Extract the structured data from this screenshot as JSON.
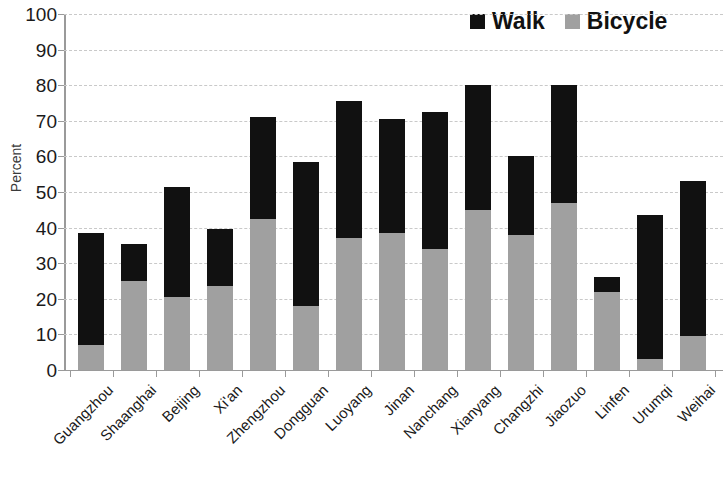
{
  "chart_data": {
    "type": "bar",
    "subtype": "stacked-vertical",
    "title": "",
    "xlabel": "",
    "ylabel": "Percent",
    "ylim": [
      0,
      100
    ],
    "yticks": [
      0,
      10,
      20,
      30,
      40,
      50,
      60,
      70,
      80,
      90,
      100
    ],
    "ytick_labels": [
      "0",
      "10",
      "20",
      "30",
      "40",
      "50",
      "60",
      "70",
      "80",
      "90",
      "100"
    ],
    "grid": true,
    "legend_position": "top-right",
    "categories": [
      "Guangzhou",
      "Shaanghai",
      "Beijing",
      "Xi'an",
      "Zhengzhou",
      "Dongguan",
      "Luoyang",
      "Jinan",
      "Nanchang",
      "Xianyang",
      "Changzhi",
      "Jiaozuo",
      "Linfen",
      "Urumqi",
      "Weihai"
    ],
    "series": [
      {
        "name": "Bicycle",
        "color": "#a0a0a0",
        "values": [
          7,
          25,
          20.5,
          23.5,
          42.5,
          18,
          37,
          38.5,
          34,
          45,
          38,
          47,
          22,
          3,
          9.5
        ]
      },
      {
        "name": "Walk",
        "color": "#111111",
        "values": [
          31.5,
          10.5,
          31,
          16,
          28.5,
          40.5,
          38.5,
          32,
          38.5,
          35,
          22,
          33,
          4,
          40.5,
          43.5
        ]
      }
    ],
    "totals": [
      38.5,
      35.5,
      51.5,
      39.5,
      71,
      58.5,
      75.5,
      70.5,
      72.5,
      80,
      60,
      80,
      26,
      43.5,
      53
    ]
  },
  "legend": {
    "entries": [
      {
        "label": "Walk",
        "color": "#111111"
      },
      {
        "label": "Bicycle",
        "color": "#a0a0a0"
      }
    ]
  },
  "axis": {
    "y_title": "Percent"
  }
}
